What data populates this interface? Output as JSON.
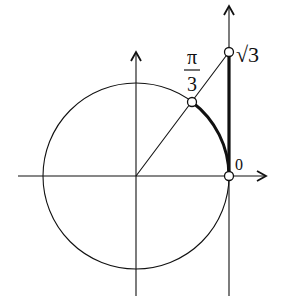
{
  "diagram": {
    "labels": {
      "angle_numerator": "π",
      "angle_denominator": "3",
      "tangent_top": "√3",
      "origin_tangent": "0"
    },
    "colors": {
      "stroke": "#111111",
      "background": "#ffffff"
    }
  }
}
